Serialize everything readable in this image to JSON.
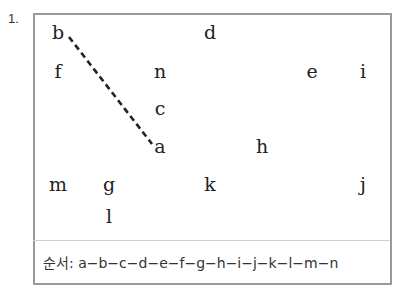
{
  "problem": {
    "number": "1.",
    "letters": [
      {
        "ch": "b",
        "x": 58,
        "y": 32
      },
      {
        "ch": "d",
        "x": 210,
        "y": 32
      },
      {
        "ch": "f",
        "x": 58,
        "y": 71
      },
      {
        "ch": "n",
        "x": 160,
        "y": 71
      },
      {
        "ch": "e",
        "x": 312,
        "y": 71
      },
      {
        "ch": "i",
        "x": 363,
        "y": 71
      },
      {
        "ch": "c",
        "x": 160,
        "y": 108
      },
      {
        "ch": "a",
        "x": 160,
        "y": 146
      },
      {
        "ch": "h",
        "x": 262,
        "y": 146
      },
      {
        "ch": "m",
        "x": 58,
        "y": 184
      },
      {
        "ch": "g",
        "x": 109,
        "y": 184
      },
      {
        "ch": "k",
        "x": 210,
        "y": 184
      },
      {
        "ch": "j",
        "x": 363,
        "y": 184
      },
      {
        "ch": "l",
        "x": 109,
        "y": 216
      }
    ],
    "dashed_line": {
      "from": "b",
      "to": "a",
      "x1": 69,
      "y1": 37,
      "x2": 152,
      "y2": 144,
      "color": "#222222"
    },
    "sequence_label": "순서:",
    "sequence": [
      "a",
      "b",
      "c",
      "d",
      "e",
      "f",
      "g",
      "h",
      "i",
      "j",
      "k",
      "l",
      "m",
      "n"
    ],
    "sequence_text": " a−b−c−d−e−f−g−h−i−j−k−l−m−n"
  }
}
